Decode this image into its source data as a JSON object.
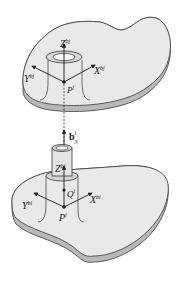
{
  "diagram": {
    "colors": {
      "plate_top": "#e9e9e9",
      "plate_edge": "#b9b9b9",
      "outline": "#3a3a3a",
      "tube_inner": "#d4d4d4",
      "background": "#ffffff"
    },
    "upper_body": {
      "z_axis": {
        "base": "Z",
        "sup": "bj"
      },
      "x_axis": {
        "base": "X",
        "sup": "bj"
      },
      "y_axis": {
        "base": "Y",
        "sup": "bj"
      },
      "origin": {
        "base": "P",
        "sup": "j"
      }
    },
    "connector": {
      "vector": {
        "base": "b",
        "sub": "3",
        "sup": "i"
      }
    },
    "lower_body": {
      "z_axis": {
        "base": "Z",
        "sup": "bi"
      },
      "x_axis": {
        "base": "X",
        "sup": "bi"
      },
      "y_axis": {
        "base": "Y",
        "sup": "bi"
      },
      "origin": {
        "base": "P",
        "sup": "i"
      },
      "point_q": {
        "base": "Q",
        "sup": "i"
      }
    }
  }
}
